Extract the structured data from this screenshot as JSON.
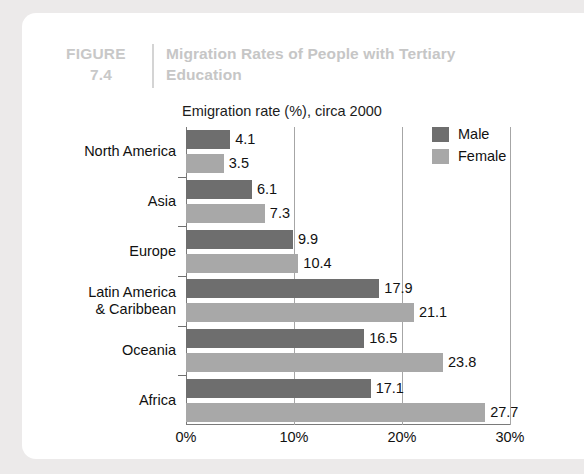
{
  "figure": {
    "number_label": "FIGURE",
    "number": "7.4",
    "title_line1": "Migration Rates of People with Tertiary",
    "title_line2": "Education"
  },
  "legend": {
    "male_label": "Male",
    "female_label": "Female",
    "male_color": "#6e6e6e",
    "female_color": "#a8a8a8"
  },
  "chart_data": {
    "type": "bar",
    "orientation": "horizontal",
    "title": "Migration Rates of People with Tertiary Education",
    "subtitle": "Emigration rate (%), circa 2000",
    "xlabel": "",
    "ylabel": "",
    "xlim": [
      0,
      30
    ],
    "xticks": [
      0,
      10,
      20,
      30
    ],
    "xtick_labels": [
      "0%",
      "10%",
      "20%",
      "30%"
    ],
    "grid": true,
    "legend_position": "top-right",
    "categories": [
      "North America",
      "Asia",
      "Europe",
      "Latin America & Caribbean",
      "Oceania",
      "Africa"
    ],
    "category_labels": [
      [
        "North America"
      ],
      [
        "Asia"
      ],
      [
        "Europe"
      ],
      [
        "Latin America",
        "& Caribbean"
      ],
      [
        "Oceania"
      ],
      [
        "Africa"
      ]
    ],
    "series": [
      {
        "name": "Male",
        "color": "#6e6e6e",
        "values": [
          4.1,
          6.1,
          9.9,
          17.9,
          16.5,
          17.1
        ]
      },
      {
        "name": "Female",
        "color": "#a8a8a8",
        "values": [
          3.5,
          7.3,
          10.4,
          21.1,
          23.8,
          27.7
        ]
      }
    ],
    "data_labels": {
      "North America": {
        "Male": "4.1",
        "Female": "3.5"
      },
      "Asia": {
        "Male": "6.1",
        "Female": "7.3"
      },
      "Europe": {
        "Male": "9.9",
        "Female": "10.4"
      },
      "Latin America & Caribbean": {
        "Male": "17.9",
        "Female": "21.1"
      },
      "Oceania": {
        "Male": "16.5",
        "Female": "23.8"
      },
      "Africa": {
        "Male": "17.1",
        "Female": "27.7"
      }
    }
  }
}
